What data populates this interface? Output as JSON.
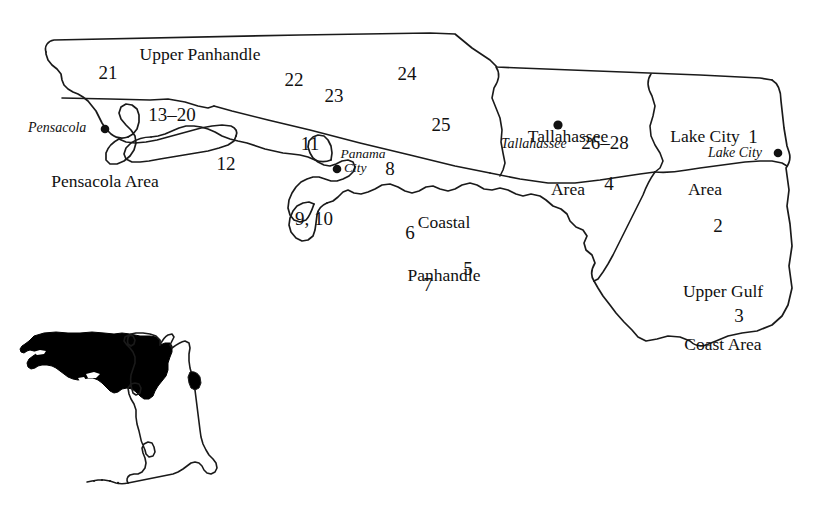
{
  "figure": {
    "kind": "reference-map",
    "background_color": "#ffffff",
    "line_color": "#1a1a1a",
    "fill_color": "#000000"
  },
  "regions": [
    {
      "id": "upper-panhandle",
      "label": "Upper Panhandle",
      "lines": [
        "Upper Panhandle"
      ]
    },
    {
      "id": "pensacola-area",
      "label": "Pensacola Area",
      "lines": [
        "Pensacola Area"
      ]
    },
    {
      "id": "coastal-panhandle",
      "label": "Coastal Panhandle",
      "lines": [
        "Coastal",
        "Panhandle"
      ]
    },
    {
      "id": "tallahassee-area",
      "label": "Tallahassee Area",
      "lines": [
        "Tallahassee",
        "Area"
      ]
    },
    {
      "id": "lake-city-area",
      "label": "Lake City Area",
      "lines": [
        "Lake City",
        "Area"
      ]
    },
    {
      "id": "upper-gulf-coast-area",
      "label": "Upper Gulf Coast Area",
      "lines": [
        "Upper Gulf",
        "Coast Area"
      ]
    }
  ],
  "region_labels": {
    "upper_panhandle": "Upper Panhandle",
    "pensacola_area": "Pensacola Area",
    "coastal_line1": "Coastal",
    "coastal_line2": "Panhandle",
    "tallahassee_line1": "Tallahassee",
    "tallahassee_line2": "Area",
    "lake_city_line1": "Lake City",
    "lake_city_line2": "Area",
    "upper_gulf_line1": "Upper Gulf",
    "upper_gulf_line2": "Coast Area"
  },
  "site_numbers": [
    {
      "id": "n1",
      "text": "1",
      "x": 753,
      "y": 139
    },
    {
      "id": "n2",
      "text": "2",
      "x": 718,
      "y": 228
    },
    {
      "id": "n3",
      "text": "3",
      "x": 739,
      "y": 318
    },
    {
      "id": "n4",
      "text": "4",
      "x": 609,
      "y": 186
    },
    {
      "id": "n5",
      "text": "5",
      "x": 468,
      "y": 271
    },
    {
      "id": "n6",
      "text": "6",
      "x": 410,
      "y": 235
    },
    {
      "id": "n7",
      "text": "7",
      "x": 428,
      "y": 288
    },
    {
      "id": "n8",
      "text": "8",
      "x": 390,
      "y": 171
    },
    {
      "id": "n9_10",
      "text": "9, 10",
      "x": 314,
      "y": 221
    },
    {
      "id": "n11",
      "text": "11",
      "x": 310,
      "y": 146
    },
    {
      "id": "n12",
      "text": "12",
      "x": 226,
      "y": 166
    },
    {
      "id": "n13_20",
      "text": "13–20",
      "x": 172,
      "y": 118
    },
    {
      "id": "n21",
      "text": "21",
      "x": 108,
      "y": 75
    },
    {
      "id": "n22",
      "text": "22",
      "x": 294,
      "y": 82
    },
    {
      "id": "n23",
      "text": "23",
      "x": 334,
      "y": 98
    },
    {
      "id": "n24",
      "text": "24",
      "x": 407,
      "y": 76
    },
    {
      "id": "n25",
      "text": "25",
      "x": 441,
      "y": 127
    },
    {
      "id": "n26_28",
      "text": "26–28",
      "x": 605,
      "y": 146
    }
  ],
  "numbers": {
    "n1": "1",
    "n2": "2",
    "n3": "3",
    "n4": "4",
    "n5": "5",
    "n6": "6",
    "n7": "7",
    "n8": "8",
    "n9_10": "9, 10",
    "n11": "11",
    "n12": "12",
    "n13_20": "13–20",
    "n21": "21",
    "n22": "22",
    "n23": "23",
    "n24": "24",
    "n25": "25",
    "n26_28": "26–28"
  },
  "cities": [
    {
      "id": "pensacola",
      "name": "Pensacola",
      "dot_x": 105,
      "dot_y": 129,
      "label_side": "left"
    },
    {
      "id": "panama-city",
      "name": "Panama City",
      "lines": [
        "Panama",
        "City"
      ],
      "dot_x": 337,
      "dot_y": 169,
      "label_side": "split"
    },
    {
      "id": "tallahassee",
      "name": "Tallahassee",
      "dot_x": 558,
      "dot_y": 125,
      "label_side": "below"
    },
    {
      "id": "lake-city",
      "name": "Lake City",
      "dot_x": 778,
      "dot_y": 153,
      "label_side": "left"
    }
  ],
  "city_labels": {
    "pensacola": "Pensacola",
    "panama_line1": "Panama",
    "panama_line2": "City",
    "tallahassee": "Tallahassee",
    "lake_city": "Lake City"
  },
  "inset": {
    "title": "Florida state outline inset",
    "highlight_description": "northern panhandle shaded solid black",
    "highlight_color": "#000000",
    "outline_color": "#1a1a1a"
  }
}
